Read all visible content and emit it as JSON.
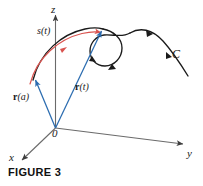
{
  "figure": {
    "caption": "FIGURE 3",
    "background_color": "#ffffff",
    "axes": {
      "z_label": "z",
      "y_label": "y",
      "x_label": "x",
      "origin_label": "0",
      "axis_color": "#555555"
    },
    "curve": {
      "name_label": "C",
      "color": "#1a1a1a",
      "description": "space curve with a loop, arrowheads indicating direction of travel"
    },
    "arc_length": {
      "label": "s(t)",
      "color": "#d9534f",
      "description": "red arc along the curve from r(a) to r(t) representing arc length"
    },
    "vectors": [
      {
        "label_bold": "r",
        "label_arg": "(a)",
        "color": "#2b6cb0",
        "description": "position vector from origin to start point of curve"
      },
      {
        "label_bold": "r",
        "label_arg": "(t)",
        "color": "#2b6cb0",
        "description": "position vector from origin to point at parameter t"
      }
    ]
  }
}
